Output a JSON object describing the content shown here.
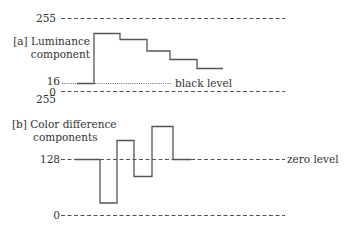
{
  "panel_a": {
    "title_line1": "[a] Luminance",
    "title_line2": "component",
    "axis_top": "255",
    "axis_ref": "16",
    "axis_bottom": "0",
    "ref_label": "black level",
    "values": [
      "blank at 16",
      "high",
      "step down",
      "step down",
      "step down",
      "step down"
    ]
  },
  "panel_b": {
    "axis_top": "255",
    "title_line1": "[b] Color difference",
    "title_line2": "components",
    "axis_ref": "128",
    "axis_bottom": "0",
    "ref_label": "zero level"
  },
  "colors": {
    "line": "#555555",
    "text": "#333333"
  }
}
